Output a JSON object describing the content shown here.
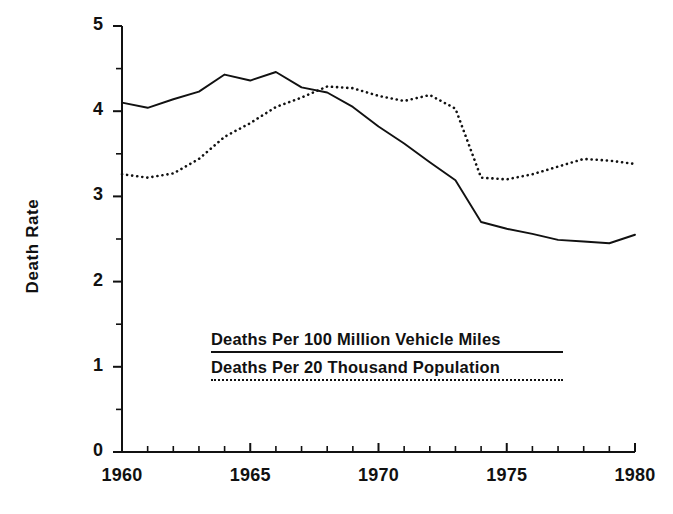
{
  "chart_data": {
    "type": "line",
    "title": "",
    "subtitle": "",
    "xlabel": "",
    "ylabel": "Death Rate",
    "xlim": [
      1960,
      1980
    ],
    "ylim": [
      0,
      5
    ],
    "grid": false,
    "legend_position": "inside-center",
    "x_ticks": [
      1960,
      1965,
      1970,
      1975,
      1980
    ],
    "x_tick_labels": [
      "1960",
      "1965",
      "1970",
      "1975",
      "1980"
    ],
    "x_minor_tick_step": 1,
    "y_ticks": [
      0,
      1,
      2,
      3,
      4,
      5
    ],
    "y_tick_labels": [
      "0",
      "1",
      "2",
      "3",
      "4",
      "5"
    ],
    "y_minor_tick_step": 0.5,
    "x": [
      1960,
      1961,
      1962,
      1963,
      1964,
      1965,
      1966,
      1967,
      1968,
      1969,
      1970,
      1971,
      1972,
      1973,
      1974,
      1975,
      1976,
      1977,
      1978,
      1979,
      1980
    ],
    "series": [
      {
        "name": "Deaths Per 100 Million Vehicle Miles",
        "style": "solid",
        "color": "#111111",
        "values": [
          4.1,
          4.04,
          4.14,
          4.23,
          4.43,
          4.36,
          4.46,
          4.28,
          4.22,
          4.05,
          3.82,
          3.62,
          3.4,
          3.19,
          2.7,
          2.62,
          2.56,
          2.49,
          2.47,
          2.45,
          2.55
        ]
      },
      {
        "name": "Deaths Per 20 Thousand Population",
        "style": "dotted",
        "color": "#111111",
        "values": [
          3.26,
          3.22,
          3.27,
          3.44,
          3.7,
          3.86,
          4.05,
          4.16,
          4.29,
          4.27,
          4.18,
          4.12,
          4.19,
          4.03,
          3.22,
          3.2,
          3.26,
          3.35,
          3.44,
          3.42,
          3.38
        ]
      }
    ]
  },
  "axes": {
    "y_axis_label": "Death Rate"
  },
  "legend": {
    "items": [
      {
        "label": "Deaths Per 100 Million Vehicle Miles",
        "style": "solid"
      },
      {
        "label": "Deaths Per 20 Thousand Population",
        "style": "dotted"
      }
    ]
  }
}
